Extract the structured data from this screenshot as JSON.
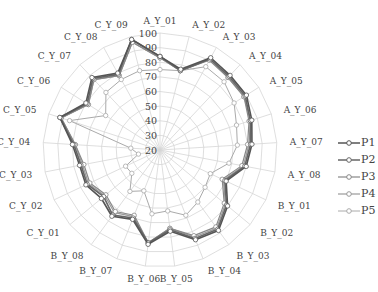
{
  "chart_data": {
    "type": "radar",
    "title": "",
    "radial_ticks": [
      20,
      30,
      40,
      50,
      60,
      70,
      80,
      90,
      100
    ],
    "rlim": [
      20,
      100
    ],
    "grid": true,
    "legend_position": "right",
    "categories": [
      "A_Y_01",
      "A_Y_02",
      "A_Y_03",
      "A_Y_04",
      "A_Y_05",
      "A_Y_06",
      "A_Y_07",
      "A_Y_08",
      "B_Y_01",
      "B_Y_02",
      "B_Y_03",
      "B_Y_04",
      "B_Y_05",
      "B_Y_06",
      "B_Y_07",
      "B_Y_08",
      "C_Y_01",
      "C_Y_02",
      "C_Y_03",
      "C_Y_04",
      "C_Y_05",
      "C_Y_06",
      "C_Y_07",
      "C_Y_08",
      "C_Y_09"
    ],
    "series": [
      {
        "name": "P1",
        "color": "#555555",
        "width": 1.6,
        "values": [
          84,
          77,
          92,
          90,
          90,
          86,
          83,
          80,
          70,
          80,
          88,
          86,
          76,
          85,
          71,
          76,
          72,
          76,
          76,
          80,
          92,
          80,
          88,
          80,
          98
        ]
      },
      {
        "name": "P2",
        "color": "#666666",
        "width": 1.6,
        "values": [
          84,
          76,
          91,
          89,
          89,
          85,
          82,
          79,
          69,
          79,
          87,
          85,
          75,
          84,
          70,
          75,
          70,
          75,
          75,
          79,
          92,
          79,
          87,
          79,
          98
        ]
      },
      {
        "name": "P3",
        "color": "#888888",
        "width": 1.2,
        "values": [
          83,
          76,
          90,
          88,
          88,
          84,
          80,
          77,
          67,
          77,
          85,
          83,
          74,
          84,
          68,
          72,
          68,
          73,
          73,
          78,
          91,
          78,
          86,
          78,
          96
        ]
      },
      {
        "name": "P4",
        "color": "#999999",
        "width": 1.2,
        "values": [
          83,
          76,
          91,
          88,
          88,
          85,
          81,
          78,
          68,
          78,
          86,
          84,
          74,
          84,
          69,
          73,
          69,
          74,
          74,
          78,
          91,
          78,
          86,
          78,
          96
        ]
      },
      {
        "name": "P5",
        "color": "#aaaaaa",
        "width": 1.0,
        "values": [
          75,
          76,
          85,
          84,
          80,
          75,
          73,
          68,
          58,
          60,
          64,
          68,
          62,
          64,
          50,
          55,
          45,
          46,
          35,
          40,
          85,
          64,
          74,
          75,
          76
        ]
      }
    ]
  },
  "legend": {
    "items": [
      {
        "label": "P1",
        "color": "#555555"
      },
      {
        "label": "P2",
        "color": "#666666"
      },
      {
        "label": "P3",
        "color": "#888888"
      },
      {
        "label": "P4",
        "color": "#999999"
      },
      {
        "label": "P5",
        "color": "#aaaaaa"
      }
    ]
  }
}
